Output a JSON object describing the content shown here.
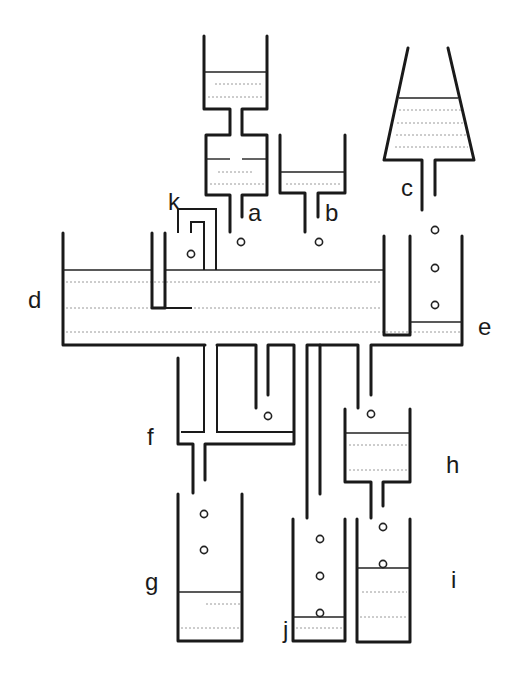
{
  "diagram": {
    "labels": {
      "a": "a",
      "b": "b",
      "c": "c",
      "d": "d",
      "e": "e",
      "f": "f",
      "g": "g",
      "h": "h",
      "i": "i",
      "j": "j",
      "k": "k"
    },
    "components": [
      {
        "id": "a",
        "type": "two-stage reservoir with neck and outlet pipe"
      },
      {
        "id": "b",
        "type": "small tank with outlet pipe"
      },
      {
        "id": "c",
        "type": "conical funnel with liquid and outlet pipe"
      },
      {
        "id": "d",
        "type": "main horizontal trough with baffle"
      },
      {
        "id": "e",
        "type": "compartment on right side of trough receiving bubbles"
      },
      {
        "id": "f",
        "type": "branched pipe manifold below trough"
      },
      {
        "id": "g",
        "type": "collection beaker with bubbles"
      },
      {
        "id": "h",
        "type": "intermediate tank with outlet pipe"
      },
      {
        "id": "i",
        "type": "collection beaker with bubbles"
      },
      {
        "id": "j",
        "type": "collection beaker with bubbles"
      },
      {
        "id": "k",
        "type": "inverted U-tube pipes into trough"
      }
    ],
    "colors": {
      "line": "#1a1a1a",
      "dashed_liquid": "#9a9a9a",
      "background": "#ffffff"
    }
  }
}
